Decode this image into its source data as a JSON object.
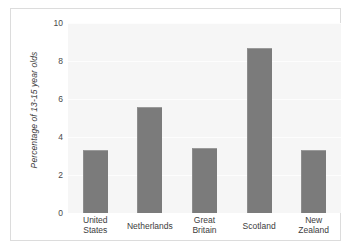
{
  "chart_data": {
    "type": "bar",
    "title": "",
    "xlabel": "",
    "ylabel": "Percentage of 13-15 year olds",
    "categories": [
      "United States",
      "Netherlands",
      "Great Britain",
      "Scotland",
      "New Zealand"
    ],
    "category_lines": [
      [
        "United",
        "States"
      ],
      [
        "Netherlands"
      ],
      [
        "Great",
        "Britain"
      ],
      [
        "Scotland"
      ],
      [
        "New",
        "Zealand"
      ]
    ],
    "values": [
      3.3,
      5.6,
      3.4,
      8.7,
      3.3
    ],
    "ylim": [
      0,
      10
    ],
    "yticks": [
      0,
      2,
      4,
      6,
      8,
      10
    ],
    "ytick_labels": [
      "0",
      "2",
      "4",
      "6",
      "8",
      "10"
    ],
    "grid": true,
    "grid_axis": "y",
    "legend": false,
    "legend_position": "none",
    "bar_color": "#7b7b7b",
    "panel_background": "#f6f6f6",
    "gridline_color": "#fdfdfd",
    "frame_color": "#dcdcdc"
  }
}
